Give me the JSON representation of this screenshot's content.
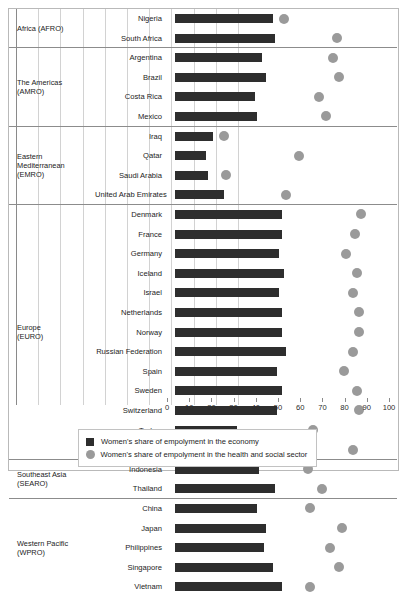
{
  "chart_data": {
    "type": "bar",
    "title": "",
    "subtitle": "",
    "xlabel": "",
    "ylabel": "",
    "xlim": [
      0,
      100
    ],
    "grid": true,
    "legend_position": "bottom",
    "xticks": [
      0,
      10,
      20,
      30,
      40,
      50,
      60,
      70,
      80,
      90,
      100
    ],
    "xticklabels": [
      "0",
      "10",
      "20",
      "30",
      "40",
      "50",
      "60",
      "70",
      "80",
      "90",
      "100"
    ],
    "series": [
      {
        "name": "Women's share of empolyment in the economy",
        "marker": "bar",
        "color": "#2e2e2e",
        "values": [
          44,
          45,
          39,
          41,
          36,
          37,
          17,
          14,
          15,
          22,
          48,
          48,
          47,
          49,
          47,
          48,
          48,
          50,
          46,
          48,
          46,
          28,
          47,
          38,
          45,
          37,
          41,
          40,
          44,
          48
        ]
      },
      {
        "name": "Women's share of empolyment in the health and social sector",
        "marker": "circle",
        "color": "#9a9a9a",
        "values": [
          49,
          73,
          71,
          74,
          65,
          68,
          22,
          56,
          23,
          50,
          84,
          81,
          77,
          82,
          80,
          83,
          83,
          80,
          76,
          82,
          83,
          62,
          80,
          60,
          66,
          61,
          75,
          70,
          74,
          61
        ]
      }
    ],
    "categories": [
      "Nigeria",
      "South Africa",
      "Argentina",
      "Brazil",
      "Costa Rica",
      "Mexico",
      "Iraq",
      "Qatar",
      "Saudi Arabia",
      "United Arab Emirates",
      "Denmark",
      "France",
      "Germany",
      "Iceland",
      "Israel",
      "Netherlands",
      "Norway",
      "Russian Federation",
      "Spain",
      "Sweden",
      "Switzerland",
      "Turkey",
      "United Kingdom",
      "Indonesia",
      "Thailand",
      "China",
      "Japan",
      "Philippines",
      "Singapore",
      "Vietnam"
    ],
    "regions": [
      {
        "name": "Africa (AFRO)",
        "rows": [
          {
            "label": "Nigeria",
            "bar": 44,
            "dot": 49
          },
          {
            "label": "South Africa",
            "bar": 45,
            "dot": 73
          }
        ]
      },
      {
        "name": "The Americas\n(AMRO)",
        "rows": [
          {
            "label": "Argentina",
            "bar": 39,
            "dot": 71
          },
          {
            "label": "Brazil",
            "bar": 41,
            "dot": 74
          },
          {
            "label": "Costa Rica",
            "bar": 36,
            "dot": 65
          },
          {
            "label": "Mexico",
            "bar": 37,
            "dot": 68
          }
        ]
      },
      {
        "name": "Eastern\nMediterranean\n(EMRO)",
        "rows": [
          {
            "label": "Iraq",
            "bar": 17,
            "dot": 22
          },
          {
            "label": "Qatar",
            "bar": 14,
            "dot": 56
          },
          {
            "label": "Saudi Arabia",
            "bar": 15,
            "dot": 23
          },
          {
            "label": "United Arab Emirates",
            "bar": 22,
            "dot": 50
          }
        ]
      },
      {
        "name": "Europe\n(EURO)",
        "rows": [
          {
            "label": "Denmark",
            "bar": 48,
            "dot": 84
          },
          {
            "label": "France",
            "bar": 48,
            "dot": 81
          },
          {
            "label": "Germany",
            "bar": 47,
            "dot": 77
          },
          {
            "label": "Iceland",
            "bar": 49,
            "dot": 82
          },
          {
            "label": "Israel",
            "bar": 47,
            "dot": 80
          },
          {
            "label": "Netherlands",
            "bar": 48,
            "dot": 83
          },
          {
            "label": "Norway",
            "bar": 48,
            "dot": 83
          },
          {
            "label": "Russian Federation",
            "bar": 50,
            "dot": 80
          },
          {
            "label": "Spain",
            "bar": 46,
            "dot": 76
          },
          {
            "label": "Sweden",
            "bar": 48,
            "dot": 82
          },
          {
            "label": "Switzerland",
            "bar": 46,
            "dot": 83
          },
          {
            "label": "Turkey",
            "bar": 28,
            "dot": 62
          },
          {
            "label": "United Kingdom",
            "bar": 47,
            "dot": 80
          }
        ]
      },
      {
        "name": "Southeast Asia\n(SEARO)",
        "rows": [
          {
            "label": "Indonesia",
            "bar": 38,
            "dot": 60
          },
          {
            "label": "Thailand",
            "bar": 45,
            "dot": 66
          }
        ]
      },
      {
        "name": "Western Pacific\n(WPRO)",
        "rows": [
          {
            "label": "China",
            "bar": 37,
            "dot": 61
          },
          {
            "label": "Japan",
            "bar": 41,
            "dot": 75
          },
          {
            "label": "Philippines",
            "bar": 40,
            "dot": 70
          },
          {
            "label": "Singapore",
            "bar": 44,
            "dot": 74
          },
          {
            "label": "Vietnam",
            "bar": 48,
            "dot": 61
          }
        ]
      }
    ],
    "legend": [
      {
        "marker": "square",
        "label": "Women's share of empolyment in the economy"
      },
      {
        "marker": "circle",
        "label": "Women's share of empolyment in the health and social sector"
      }
    ]
  }
}
